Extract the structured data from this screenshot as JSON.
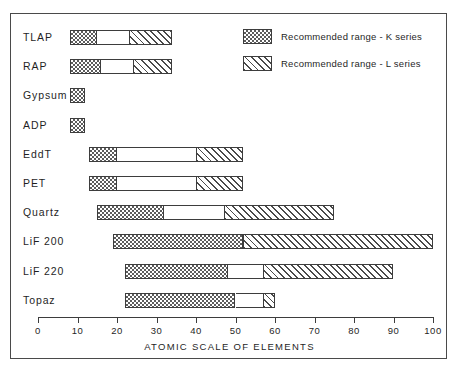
{
  "chart_data": {
    "type": "bar",
    "title": "",
    "xlabel": "ATOMIC  SCALE  OF  ELEMENTS",
    "ylabel": "",
    "xlim": [
      0,
      100
    ],
    "xticks": [
      0,
      10,
      20,
      30,
      40,
      50,
      60,
      70,
      80,
      90,
      100
    ],
    "grid": false,
    "orientation": "horizontal",
    "legend_position": "top-right",
    "legend": [
      {
        "key": "k-series",
        "label": "Recommended range - K series",
        "pattern": "checker"
      },
      {
        "key": "l-series",
        "label": "Recommended range - L series",
        "pattern": "diagonal-hatch"
      }
    ],
    "categories": [
      "TLAP",
      "RAP",
      "Gypsum",
      "ADP",
      "EddT",
      "PET",
      "Quartz",
      "LiF 200",
      "LiF 220",
      "Topaz"
    ],
    "series": [
      {
        "name": "Recommended range - K series",
        "pattern": "checker",
        "ranges": [
          {
            "category": "TLAP",
            "start": 8,
            "end": 15
          },
          {
            "category": "RAP",
            "start": 8,
            "end": 16
          },
          {
            "category": "Gypsum",
            "start": 8,
            "end": 12
          },
          {
            "category": "ADP",
            "start": 8,
            "end": 12
          },
          {
            "category": "EddT",
            "start": 13,
            "end": 20
          },
          {
            "category": "PET",
            "start": 13,
            "end": 20
          },
          {
            "category": "Quartz",
            "start": 15,
            "end": 32
          },
          {
            "category": "LiF 200",
            "start": 19,
            "end": 52
          },
          {
            "category": "LiF 220",
            "start": 22,
            "end": 48
          },
          {
            "category": "Topaz",
            "start": 22,
            "end": 50
          }
        ]
      },
      {
        "name": "Recommended range - L series",
        "pattern": "diagonal-hatch",
        "ranges": [
          {
            "category": "TLAP",
            "start": 23,
            "end": 34
          },
          {
            "category": "RAP",
            "start": 24,
            "end": 34
          },
          {
            "category": "EddT",
            "start": 40,
            "end": 52
          },
          {
            "category": "PET",
            "start": 40,
            "end": 52
          },
          {
            "category": "Quartz",
            "start": 47,
            "end": 75
          },
          {
            "category": "LiF 200",
            "start": 52,
            "end": 100
          },
          {
            "category": "LiF 220",
            "start": 57,
            "end": 90
          },
          {
            "category": "Topaz",
            "start": 57,
            "end": 60
          }
        ]
      }
    ]
  },
  "colors": {
    "frame": "#4a4a4a",
    "ink": "#1f1f1f",
    "pattern": "#4a4a4a",
    "background": "#ffffff"
  }
}
